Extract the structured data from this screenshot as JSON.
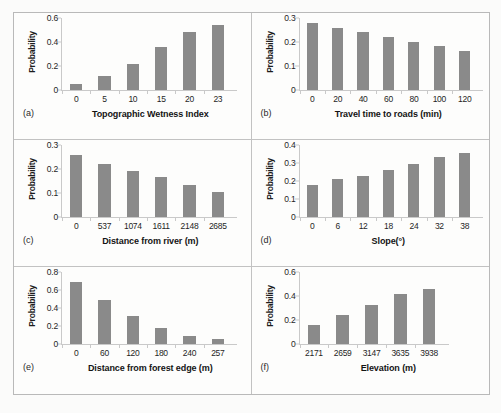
{
  "figure": {
    "bar_color": "#8a8a8a",
    "axis_color": "#c9c9c9",
    "frame_color": "#b9b9b9",
    "background": "#fdfdfc",
    "shared_ylabel": "Probability"
  },
  "chart_data": [
    {
      "type": "bar",
      "panel": "(a)",
      "title": "",
      "xlabel": "Topographic Wetness Index",
      "ylabel": "Probability",
      "categories": [
        "0",
        "5",
        "10",
        "15",
        "20",
        "23"
      ],
      "values": [
        0.05,
        0.12,
        0.22,
        0.355,
        0.48,
        0.545
      ],
      "ylim": [
        0,
        0.6
      ],
      "yticks": [
        "0",
        "0.2",
        "0.4",
        "0.6"
      ],
      "ytick_values": [
        0,
        0.2,
        0.4,
        0.6
      ],
      "grid": false,
      "legend": "none"
    },
    {
      "type": "bar",
      "panel": "(b)",
      "title": "",
      "xlabel": "Travel time to roads (min)",
      "ylabel": "Probability",
      "categories": [
        "0",
        "20",
        "40",
        "60",
        "80",
        "100",
        "120"
      ],
      "values": [
        0.278,
        0.26,
        0.24,
        0.22,
        0.2,
        0.182,
        0.163
      ],
      "ylim": [
        0,
        0.3
      ],
      "yticks": [
        "0",
        "0.1",
        "0.2",
        "0.3"
      ],
      "ytick_values": [
        0,
        0.1,
        0.2,
        0.3
      ],
      "grid": false,
      "legend": "none"
    },
    {
      "type": "bar",
      "panel": "(c)",
      "title": "",
      "xlabel": "Distance from river (m)",
      "ylabel": "Probability",
      "categories": [
        "0",
        "537",
        "1074",
        "1611",
        "2148",
        "2685"
      ],
      "values": [
        0.26,
        0.222,
        0.192,
        0.165,
        0.133,
        0.104
      ],
      "ylim": [
        0,
        0.3
      ],
      "yticks": [
        "0",
        "0.1",
        "0.2",
        "0.3"
      ],
      "ytick_values": [
        0,
        0.1,
        0.2,
        0.3
      ],
      "grid": false,
      "legend": "none"
    },
    {
      "type": "bar",
      "panel": "(d)",
      "title": "",
      "xlabel": "Slope(°)",
      "ylabel": "Probability",
      "categories": [
        "0",
        "6",
        "12",
        "18",
        "24",
        "32",
        "38"
      ],
      "values": [
        0.178,
        0.21,
        0.23,
        0.26,
        0.292,
        0.332,
        0.353
      ],
      "ylim": [
        0,
        0.4
      ],
      "yticks": [
        "0",
        "0.1",
        "0.2",
        "0.3",
        "0.4"
      ],
      "ytick_values": [
        0,
        0.1,
        0.2,
        0.3,
        0.4
      ],
      "grid": false,
      "legend": "none"
    },
    {
      "type": "bar",
      "panel": "(e)",
      "title": "",
      "xlabel": "Distance from forest edge (m)",
      "ylabel": "Probability",
      "categories": [
        "0",
        "60",
        "120",
        "180",
        "240",
        "257"
      ],
      "values": [
        0.685,
        0.49,
        0.315,
        0.175,
        0.09,
        0.055
      ],
      "ylim": [
        0,
        0.8
      ],
      "yticks": [
        "0",
        "0.2",
        "0.4",
        "0.6",
        "0.8"
      ],
      "ytick_values": [
        0,
        0.2,
        0.4,
        0.6,
        0.8
      ],
      "grid": false,
      "legend": "none"
    },
    {
      "type": "bar",
      "panel": "(f)",
      "title": "",
      "xlabel": "Elevation (m)",
      "ylabel": "Probability",
      "categories": [
        "2171",
        "2659",
        "3147",
        "3635",
        "3938"
      ],
      "values": [
        0.16,
        0.24,
        0.325,
        0.415,
        0.46
      ],
      "ylim": [
        0,
        0.6
      ],
      "yticks": [
        "0",
        "0.2",
        "0.4",
        "0.6"
      ],
      "ytick_values": [
        0,
        0.2,
        0.4,
        0.6
      ],
      "grid": false,
      "legend": "none"
    }
  ]
}
